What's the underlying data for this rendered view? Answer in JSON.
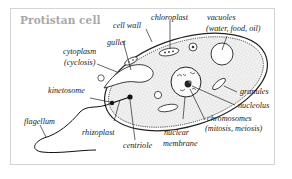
{
  "title": "Protistan cell",
  "labels": {
    "cell_wall": "cell wall",
    "chloroplast": "chloroplast",
    "vacuoles_line1": "vacuoles",
    "vacuoles_line2": "(water, food, oil)",
    "gullet": "gullet",
    "cytoplasm_line1": "cytoplasm",
    "cytoplasm_line2": "(cyclosis)",
    "kinetosome": "kinetosome",
    "granules": "granules",
    "nucleolus": "nucleolus",
    "chromosomes_line1": "chromosomes",
    "chromosomes_line2": "(mitosis, meiosis)",
    "flagellum": "flagellum",
    "rhizoplast": "rhizoplast",
    "centriole": "centriole",
    "nuclear_line1": "nuclear",
    "nuclear_line2": "membrane"
  },
  "colors": {
    "title": "#a8a8a8",
    "line": "#222222",
    "frame": "#d4d4d4",
    "cytoplasm_fill": "#ececec"
  }
}
